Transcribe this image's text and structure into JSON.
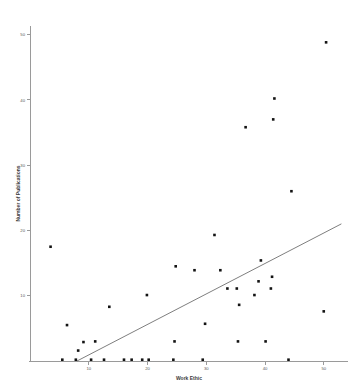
{
  "chart_data": {
    "type": "scatter",
    "title": "",
    "xlabel": "Work Ethic",
    "ylabel": "Number of Publications",
    "xlim": [
      0,
      56
    ],
    "ylim": [
      0,
      52
    ],
    "xticks": [
      10,
      20,
      30,
      40,
      50
    ],
    "yticks": [
      10,
      20,
      30,
      40,
      50
    ],
    "xtick_labels": [
      "10",
      "20",
      "30",
      "40",
      "50"
    ],
    "ytick_labels": [
      "10",
      "20",
      "30",
      "40",
      "50"
    ],
    "grid": false,
    "legend": false,
    "marker_color": "#131313",
    "marker_shape": "square",
    "points": [
      {
        "x": 3.5,
        "y": 17.5
      },
      {
        "x": 5.5,
        "y": 0.2
      },
      {
        "x": 6.3,
        "y": 5.5
      },
      {
        "x": 7.8,
        "y": 0.2
      },
      {
        "x": 8.2,
        "y": 1.6
      },
      {
        "x": 9.1,
        "y": 2.9
      },
      {
        "x": 10.4,
        "y": 0.2
      },
      {
        "x": 11.1,
        "y": 3.0
      },
      {
        "x": 12.6,
        "y": 0.2
      },
      {
        "x": 13.5,
        "y": 8.3
      },
      {
        "x": 16.0,
        "y": 0.2
      },
      {
        "x": 17.3,
        "y": 0.2
      },
      {
        "x": 19.1,
        "y": 0.2
      },
      {
        "x": 19.9,
        "y": 10.1
      },
      {
        "x": 20.2,
        "y": 0.2
      },
      {
        "x": 24.4,
        "y": 0.2
      },
      {
        "x": 24.6,
        "y": 3.0
      },
      {
        "x": 24.8,
        "y": 14.5
      },
      {
        "x": 28.0,
        "y": 13.9
      },
      {
        "x": 29.4,
        "y": 0.2
      },
      {
        "x": 29.8,
        "y": 5.7
      },
      {
        "x": 31.4,
        "y": 19.3
      },
      {
        "x": 32.4,
        "y": 13.9
      },
      {
        "x": 33.6,
        "y": 11.1
      },
      {
        "x": 35.2,
        "y": 11.1
      },
      {
        "x": 35.4,
        "y": 3.0
      },
      {
        "x": 35.6,
        "y": 8.6
      },
      {
        "x": 36.7,
        "y": 35.8
      },
      {
        "x": 38.2,
        "y": 10.1
      },
      {
        "x": 38.9,
        "y": 12.2
      },
      {
        "x": 39.3,
        "y": 15.4
      },
      {
        "x": 40.1,
        "y": 3.0
      },
      {
        "x": 41.0,
        "y": 11.1
      },
      {
        "x": 41.2,
        "y": 12.9
      },
      {
        "x": 41.4,
        "y": 37.0
      },
      {
        "x": 41.6,
        "y": 40.2
      },
      {
        "x": 44.0,
        "y": 0.2
      },
      {
        "x": 44.5,
        "y": 26.0
      },
      {
        "x": 50.0,
        "y": 7.6
      },
      {
        "x": 50.4,
        "y": 48.8
      }
    ],
    "fit_line": {
      "visible": true,
      "x_start": 8.0,
      "y_start": 0.0,
      "x_end": 53.0,
      "y_end": 21.0,
      "color": "#6f6f6f"
    }
  }
}
